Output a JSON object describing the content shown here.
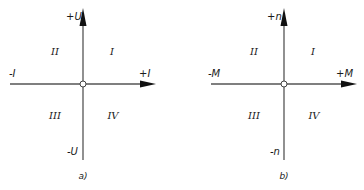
{
  "diagrams": [
    {
      "caption": "a)",
      "axes": {
        "vertical_pos": "+U",
        "vertical_neg": "-U",
        "horizontal_pos": "+I",
        "horizontal_neg": "-I"
      },
      "quadrants": {
        "q1": "I",
        "q2": "II",
        "q3": "III",
        "q4": "IV"
      }
    },
    {
      "caption": "b)",
      "axes": {
        "vertical_pos": "+n",
        "vertical_neg": "-n",
        "horizontal_pos": "+M",
        "horizontal_neg": "-M"
      },
      "quadrants": {
        "q1": "I",
        "q2": "II",
        "q3": "III",
        "q4": "IV"
      }
    }
  ],
  "colors": {
    "line": "#555555",
    "arrow": "#111111",
    "text": "#1a1a1a"
  }
}
